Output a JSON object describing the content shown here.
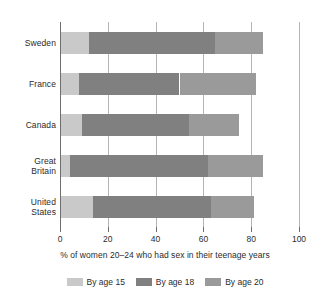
{
  "chart_data": {
    "type": "bar",
    "orientation": "horizontal",
    "stacked": true,
    "stack_mode": "cumulative-thresholds",
    "title": "",
    "subtitle": "",
    "xlabel": "% of women 20–24 who had sex in their teenage years",
    "ylabel": "",
    "xlim": [
      0,
      100
    ],
    "ylim": null,
    "grid": true,
    "grid_axis": "x",
    "legend_position": "bottom",
    "categories": [
      "Sweden",
      "France",
      "Canada",
      "Great Britain",
      "United States"
    ],
    "xticks": [
      0,
      20,
      40,
      60,
      80,
      100
    ],
    "xtick_labels": [
      "0",
      "20",
      "40",
      "60",
      "80",
      "100"
    ],
    "series": [
      {
        "name": "By age 15",
        "color": "#c9c9c9",
        "values": [
          12,
          8,
          9,
          4,
          14
        ]
      },
      {
        "name": "By age 18",
        "color": "#808080",
        "values": [
          65,
          50,
          54,
          62,
          63
        ]
      },
      {
        "name": "By age 20",
        "color": "#9a9a9a",
        "values": [
          85,
          82,
          75,
          85,
          81
        ]
      }
    ],
    "segment_widths": [
      {
        "category": "Sweden",
        "by_age_15": 12,
        "age_15_to_18": 53,
        "age_18_to_20": 20,
        "total": 85
      },
      {
        "category": "France",
        "by_age_15": 8,
        "age_15_to_18": 42,
        "age_18_to_20": 32,
        "total": 82
      },
      {
        "category": "Canada",
        "by_age_15": 9,
        "age_15_to_18": 45,
        "age_18_to_20": 21,
        "total": 75
      },
      {
        "category": "Great Britain",
        "by_age_15": 4,
        "age_15_to_18": 58,
        "age_18_to_20": 23,
        "total": 85
      },
      {
        "category": "United States",
        "by_age_15": 14,
        "age_15_to_18": 49,
        "age_18_to_20": 18,
        "total": 81
      }
    ]
  },
  "category_labels": [
    {
      "lines": [
        "Sweden"
      ]
    },
    {
      "lines": [
        "France"
      ]
    },
    {
      "lines": [
        "Canada"
      ]
    },
    {
      "lines": [
        "Great",
        "Britain"
      ]
    },
    {
      "lines": [
        "United",
        "States"
      ]
    }
  ],
  "legend": {
    "items": [
      {
        "label": "By age 15",
        "color": "#c9c9c9"
      },
      {
        "label": "By age 18",
        "color": "#808080"
      },
      {
        "label": "By age 20",
        "color": "#9a9a9a"
      }
    ]
  },
  "colors": {
    "age_15": "#c9c9c9",
    "age_18": "#808080",
    "age_20": "#9a9a9a",
    "gridline": "#b4b4b4",
    "axis": "#6e6e6e",
    "text": "#2b2b2b",
    "background": "#ffffff"
  }
}
